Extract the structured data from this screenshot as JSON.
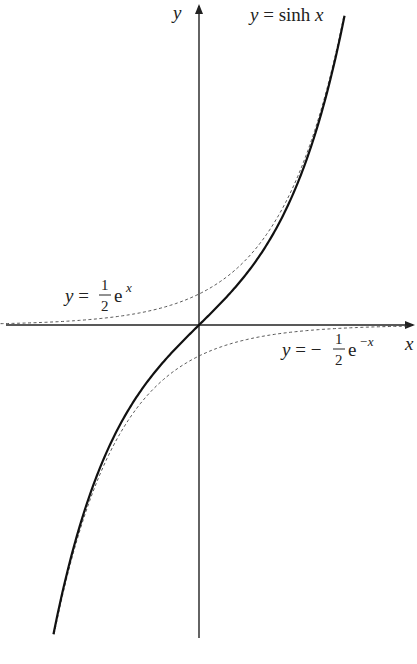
{
  "chart_data": {
    "type": "line",
    "title": "",
    "xlabel": "x",
    "ylabel": "y",
    "grid": false,
    "legend": "inline annotations",
    "xlim": [
      -3.15,
      3.45
    ],
    "ylim": [
      -5.15,
      5.25
    ],
    "series": [
      {
        "name": "y = sinh x",
        "style": "solid",
        "function": "sinh(x)",
        "x_range": [
          -2.31,
          2.31
        ]
      },
      {
        "name": "y = 1/2 e^x",
        "style": "dashed",
        "function": "0.5*exp(x)",
        "x_range": [
          -3.15,
          2.3
        ]
      },
      {
        "name": "y = -1/2 e^-x",
        "style": "dashed",
        "function": "-0.5*exp(-x)",
        "x_range": [
          -2.3,
          3.3
        ]
      }
    ],
    "annotations": [
      {
        "text": "y = sinh x",
        "near": "upper right end of solid curve"
      },
      {
        "text": "y = ½ e^x",
        "near": "left, above x-axis"
      },
      {
        "text": "y = −½ e^−x",
        "near": "right, below x-axis"
      }
    ]
  },
  "labels": {
    "x_axis": "x",
    "y_axis": "y",
    "sinh": {
      "lhs": "y =",
      "rhs": "sinh x"
    },
    "half_exp": {
      "lhs": "y =",
      "num": "1",
      "den": "2",
      "base": "e",
      "exp": "x"
    },
    "neg_half_exp": {
      "lhs": "y = −",
      "num": "1",
      "den": "2",
      "base": "e",
      "exp": "−x"
    }
  },
  "colors": {
    "axis": "#222222",
    "curve": "#111111",
    "dashed": "#444444"
  }
}
